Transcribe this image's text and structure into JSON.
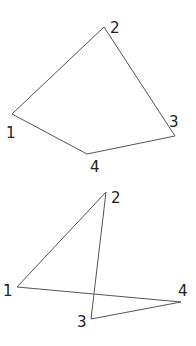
{
  "diagrams": [
    {
      "name": "simple-quadrilateral",
      "vertices": [
        {
          "label": "1",
          "x": 12,
          "y": 114,
          "lx": 6,
          "ly": 138
        },
        {
          "label": "2",
          "x": 104,
          "y": 27,
          "lx": 110,
          "ly": 33
        },
        {
          "label": "3",
          "x": 175,
          "y": 136,
          "lx": 169,
          "ly": 127
        },
        {
          "label": "4",
          "x": 87,
          "y": 154,
          "lx": 90,
          "ly": 172
        }
      ],
      "edges": [
        [
          0,
          1
        ],
        [
          1,
          2
        ],
        [
          2,
          3
        ],
        [
          3,
          0
        ]
      ]
    },
    {
      "name": "self-intersecting-quadrilateral",
      "vertices": [
        {
          "label": "1",
          "x": 17,
          "y": 287,
          "lx": 3,
          "ly": 296
        },
        {
          "label": "2",
          "x": 106,
          "y": 192,
          "lx": 111,
          "ly": 203
        },
        {
          "label": "3",
          "x": 91,
          "y": 319,
          "lx": 77,
          "ly": 327
        },
        {
          "label": "4",
          "x": 181,
          "y": 302,
          "lx": 178,
          "ly": 296
        }
      ],
      "edges": [
        [
          0,
          1
        ],
        [
          1,
          2
        ],
        [
          2,
          3
        ],
        [
          3,
          0
        ]
      ]
    }
  ]
}
